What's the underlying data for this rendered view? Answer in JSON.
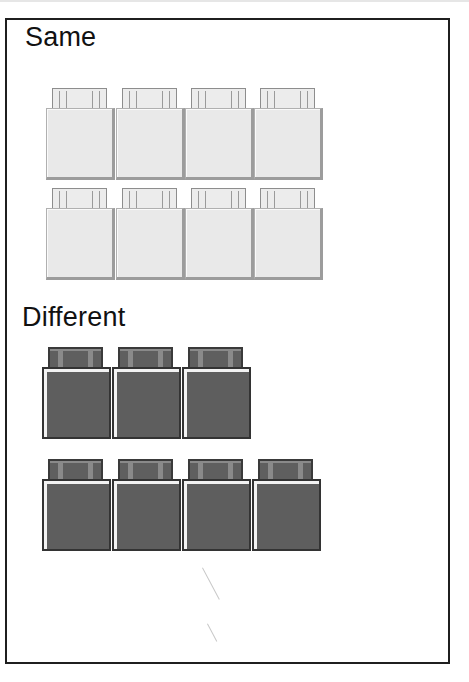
{
  "figure": {
    "sections": [
      {
        "label": "Same",
        "color": "#e9e9e9",
        "rows": [
          {
            "bricks": 4
          },
          {
            "bricks": 4
          }
        ]
      },
      {
        "label": "Different",
        "color": "#5e5e5e",
        "rows": [
          {
            "bricks": 3
          },
          {
            "bricks": 4
          }
        ]
      }
    ]
  }
}
